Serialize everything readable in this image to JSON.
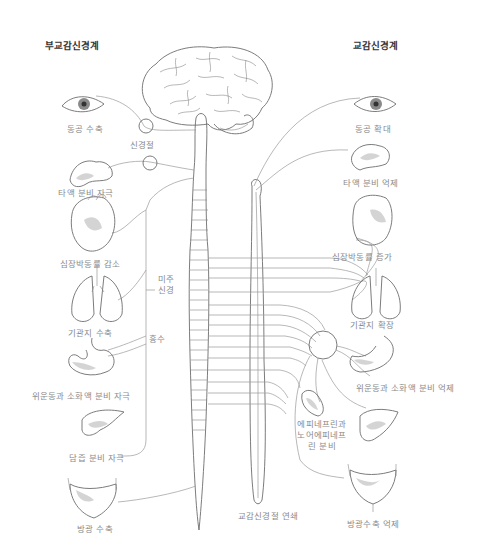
{
  "headers": {
    "parasympathetic": "부교감신경계",
    "sympathetic": "교감신경계"
  },
  "parasympathetic_labels": {
    "eye": "동공 수축",
    "ganglion": "신경절",
    "salivary": "타액 분비 자극",
    "heart": "심장박동률 감소",
    "vagus": "미주\n신경",
    "lungs": "기관지 수축",
    "medulla_spine": "흉수",
    "stomach": "위운동과 소화액 분비 자극",
    "liver": "담즙 분비 자극",
    "bladder": "방광 수축"
  },
  "sympathetic_labels": {
    "eye": "동공 확대",
    "salivary": "타액 분비 억제",
    "heart": "심장박동률 증가",
    "lungs": "기관지 확장",
    "stomach": "위운동과 소화액 분비 억제",
    "adrenal": "에피네프린과\n노어에피네프\n린 분비",
    "bladder": "방광수축 억제",
    "chain": "교감신경절 연쇄"
  },
  "colors": {
    "line": "#6d6d6d",
    "nerve": "#9a9a9a",
    "label": "#8a8a8a",
    "header": "#333333"
  }
}
